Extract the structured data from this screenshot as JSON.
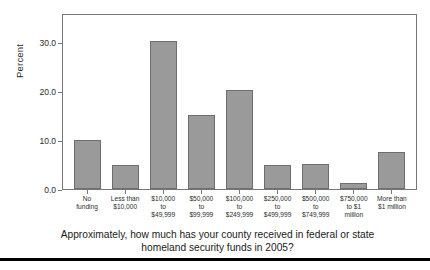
{
  "chart_data": {
    "type": "bar",
    "title": "",
    "subtitle": "",
    "xlabel": "Approximately, how much has your county received in federal or state homeland security funds in 2005?",
    "ylabel": "Percent",
    "ylim": [
      0.0,
      36.0
    ],
    "yticks": [
      "0.0",
      "10.0",
      "20.0",
      "30.0"
    ],
    "ytick_values": [
      0.0,
      10.0,
      20.0,
      30.0
    ],
    "grid": false,
    "legend": "none",
    "categories": [
      "No\nfunding",
      "Less than\n$10,000",
      "$10,000\nto\n$49,999",
      "$50,000\nto\n$99,999",
      "$100,000\nto\n$249,999",
      "$250,000\nto\n$499,999",
      "$500,000\nto\n$749,999",
      "$750,000\nto $1\nmillion",
      "More than\n$1 million"
    ],
    "values": [
      10.0,
      5.0,
      30.3,
      15.1,
      20.3,
      5.0,
      5.1,
      1.3,
      7.6
    ],
    "bar_color": "#9a9a9a",
    "bar_edge_color": "#6e6e6e",
    "axis_color": "#777777"
  },
  "caption": {
    "line1": "Approximately, how much has your county received in federal or state",
    "line2": "homeland security funds in 2005?"
  }
}
